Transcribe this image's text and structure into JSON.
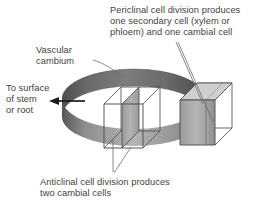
{
  "figure": {
    "type": "botany-diagram",
    "background_color": "#ffffff",
    "labels": {
      "periclinal": "Periclinal cell division produces\none secondary cell (xylem or\nphloem) and one cambial cell",
      "vascular_cambium": "Vascular\ncambium",
      "to_surface": "To surface\nof stem\nor root",
      "anticlinal": "Anticlinal cell division produces\ntwo cambial cells"
    },
    "colors": {
      "text": "#3f3f3f",
      "ring_dark": "#575757",
      "ring_mid": "#6e6e6e",
      "ring_front": "#a8a8a8",
      "ring_front_light": "#bdbdbd",
      "cell_face": "#a0a0a0",
      "cell_face_light": "#b5b5b5",
      "cell_outline": "#4a4a4a",
      "leader_line": "#6b6b6b",
      "arrow": "#1a1a1a"
    },
    "elements": {
      "ring_name": "vascular-cambium-ring",
      "left_cell_name": "anticlinal-dividing-cell",
      "right_cell_name": "periclinal-dividing-cell",
      "arrow_direction": "left"
    }
  }
}
